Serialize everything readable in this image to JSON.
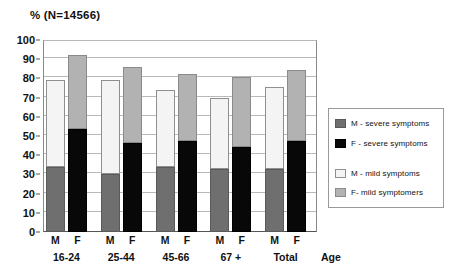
{
  "chart_data": {
    "type": "bar",
    "title": "% (N=14566)",
    "xlabel": "Age",
    "ylabel": "",
    "ylim": [
      0,
      100
    ],
    "grid": true,
    "stacked": true,
    "legend_position": "right",
    "y_ticks": [
      0,
      10,
      20,
      30,
      40,
      50,
      60,
      70,
      80,
      90,
      100
    ],
    "categories": [
      "16-24",
      "25-44",
      "45-66",
      "67 +",
      "Total"
    ],
    "sub_categories": [
      "M",
      "F"
    ],
    "series": [
      {
        "name": "M - severe symptoms",
        "color": "#6f6f6f",
        "sex": "M",
        "values": [
          34,
          30,
          34,
          33,
          33
        ]
      },
      {
        "name": "M - mild symptoms",
        "color": "#f4f4f4",
        "sex": "M",
        "values": [
          45,
          49,
          40,
          37,
          42.5
        ]
      },
      {
        "name": "F - severe symptoms",
        "color": "#080808",
        "sex": "F",
        "values": [
          53.5,
          46.5,
          47.5,
          44.5,
          47.5
        ]
      },
      {
        "name": "F- mild symptomers",
        "color": "#b2b2b2",
        "sex": "F",
        "values": [
          38.5,
          39.5,
          35,
          36,
          37
        ]
      }
    ],
    "bar_totals": {
      "M": [
        79,
        79,
        74,
        70,
        75.5
      ],
      "F": [
        92,
        86,
        82.5,
        80.5,
        84.5
      ]
    }
  },
  "legend": {
    "items": [
      {
        "label": "M - severe symptoms",
        "swatch": "m-severe"
      },
      {
        "label": "F - severe symptoms",
        "swatch": "f-severe"
      },
      {
        "label": "M - mild symptoms",
        "swatch": "m-mild"
      },
      {
        "label": "F- mild symptomers",
        "swatch": "f-mild"
      }
    ]
  },
  "colors": {
    "m_severe": "#6f6f6f",
    "f_severe": "#080808",
    "m_mild": "#f4f4f4",
    "f_mild": "#b2b2b2",
    "gridline": "#b9b9b9",
    "axis": "#555555"
  }
}
